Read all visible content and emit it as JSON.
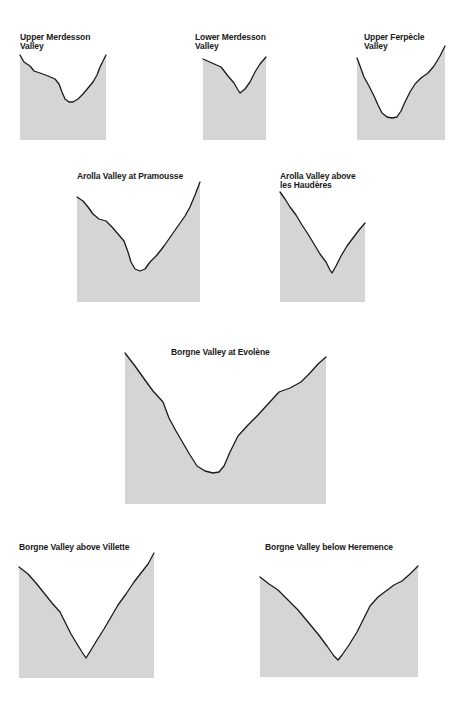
{
  "figure": {
    "fill_color": "#d5d5d5",
    "line_color": "#1a1a1a"
  },
  "panels": [
    {
      "id": "upper-merdesson",
      "title": "Upper Merdesson\nValley",
      "title_pos": [
        20,
        33
      ],
      "box": [
        20,
        55,
        106,
        140
      ],
      "profile": [
        [
          20,
          55
        ],
        [
          24,
          62
        ],
        [
          30,
          66
        ],
        [
          34,
          71
        ],
        [
          40,
          73
        ],
        [
          48,
          76
        ],
        [
          55,
          79
        ],
        [
          59,
          84
        ],
        [
          62,
          92
        ],
        [
          65,
          99
        ],
        [
          69,
          102
        ],
        [
          73,
          102
        ],
        [
          78,
          99
        ],
        [
          83,
          94
        ],
        [
          88,
          88
        ],
        [
          93,
          82
        ],
        [
          97,
          75
        ],
        [
          100,
          67
        ],
        [
          103,
          61
        ],
        [
          106,
          55
        ]
      ]
    },
    {
      "id": "lower-merdesson",
      "title": "Lower Merdesson\nValley",
      "title_pos": [
        195,
        33
      ],
      "box": [
        203,
        59,
        266,
        140
      ],
      "profile": [
        [
          203,
          59
        ],
        [
          212,
          63
        ],
        [
          221,
          67
        ],
        [
          228,
          76
        ],
        [
          234,
          83
        ],
        [
          238,
          90
        ],
        [
          240,
          93
        ],
        [
          245,
          89
        ],
        [
          250,
          82
        ],
        [
          255,
          72
        ],
        [
          260,
          64
        ],
        [
          266,
          57
        ]
      ]
    },
    {
      "id": "upper-ferpecle",
      "title": "Upper Ferpècle\nValley",
      "title_pos": [
        364,
        33
      ],
      "box": [
        357,
        45,
        445,
        140
      ],
      "profile": [
        [
          357,
          58
        ],
        [
          360,
          66
        ],
        [
          364,
          77
        ],
        [
          369,
          86
        ],
        [
          374,
          96
        ],
        [
          378,
          105
        ],
        [
          382,
          113
        ],
        [
          387,
          117
        ],
        [
          392,
          118
        ],
        [
          397,
          117
        ],
        [
          401,
          111
        ],
        [
          405,
          102
        ],
        [
          410,
          92
        ],
        [
          415,
          84
        ],
        [
          421,
          78
        ],
        [
          428,
          73
        ],
        [
          434,
          66
        ],
        [
          440,
          56
        ],
        [
          445,
          46
        ]
      ]
    },
    {
      "id": "arolla-pramousse",
      "title": "Arolla Valley at Pramousse",
      "title_pos": [
        77,
        172
      ],
      "box": [
        77,
        181,
        200,
        302
      ],
      "profile": [
        [
          77,
          197
        ],
        [
          83,
          201
        ],
        [
          88,
          207
        ],
        [
          93,
          214
        ],
        [
          99,
          219
        ],
        [
          106,
          221
        ],
        [
          112,
          227
        ],
        [
          118,
          234
        ],
        [
          124,
          241
        ],
        [
          128,
          252
        ],
        [
          131,
          262
        ],
        [
          135,
          269
        ],
        [
          140,
          271
        ],
        [
          145,
          269
        ],
        [
          150,
          262
        ],
        [
          157,
          255
        ],
        [
          164,
          246
        ],
        [
          171,
          236
        ],
        [
          178,
          226
        ],
        [
          185,
          216
        ],
        [
          190,
          207
        ],
        [
          195,
          195
        ],
        [
          200,
          182
        ]
      ]
    },
    {
      "id": "arolla-haudères",
      "title": "Arolla Valley above\nles Haudères",
      "title_pos": [
        280,
        172
      ],
      "box": [
        280,
        192,
        365,
        302
      ],
      "profile": [
        [
          280,
          192
        ],
        [
          285,
          199
        ],
        [
          290,
          207
        ],
        [
          296,
          215
        ],
        [
          302,
          225
        ],
        [
          308,
          234
        ],
        [
          314,
          244
        ],
        [
          320,
          254
        ],
        [
          326,
          262
        ],
        [
          330,
          270
        ],
        [
          332,
          273
        ],
        [
          336,
          266
        ],
        [
          341,
          256
        ],
        [
          347,
          246
        ],
        [
          353,
          238
        ],
        [
          359,
          230
        ],
        [
          365,
          223
        ]
      ]
    },
    {
      "id": "borgne-evolene",
      "title": "Borgne Valley at Evolène",
      "title_pos": [
        171,
        348
      ],
      "box": [
        125,
        353,
        326,
        504
      ],
      "profile": [
        [
          125,
          353
        ],
        [
          135,
          366
        ],
        [
          145,
          380
        ],
        [
          153,
          391
        ],
        [
          163,
          402
        ],
        [
          169,
          418
        ],
        [
          176,
          431
        ],
        [
          183,
          443
        ],
        [
          190,
          455
        ],
        [
          197,
          466
        ],
        [
          205,
          471
        ],
        [
          213,
          473
        ],
        [
          219,
          472
        ],
        [
          224,
          466
        ],
        [
          230,
          452
        ],
        [
          238,
          436
        ],
        [
          248,
          425
        ],
        [
          258,
          415
        ],
        [
          268,
          404
        ],
        [
          279,
          392
        ],
        [
          290,
          388
        ],
        [
          301,
          382
        ],
        [
          310,
          373
        ],
        [
          318,
          364
        ],
        [
          326,
          357
        ]
      ]
    },
    {
      "id": "borgne-villette",
      "title": "Borgne Valley above Villette",
      "title_pos": [
        19,
        543
      ],
      "box": [
        19,
        553,
        154,
        678
      ],
      "profile": [
        [
          19,
          567
        ],
        [
          28,
          574
        ],
        [
          36,
          583
        ],
        [
          44,
          593
        ],
        [
          52,
          603
        ],
        [
          60,
          612
        ],
        [
          66,
          624
        ],
        [
          71,
          634
        ],
        [
          77,
          644
        ],
        [
          82,
          652
        ],
        [
          86,
          658
        ],
        [
          91,
          650
        ],
        [
          97,
          640
        ],
        [
          104,
          629
        ],
        [
          111,
          617
        ],
        [
          118,
          605
        ],
        [
          126,
          594
        ],
        [
          134,
          582
        ],
        [
          141,
          573
        ],
        [
          148,
          564
        ],
        [
          154,
          553
        ]
      ]
    },
    {
      "id": "borgne-heremence",
      "title": "Borgne Valley below Heremence",
      "title_pos": [
        265,
        543
      ],
      "box": [
        260,
        566,
        418,
        677
      ],
      "profile": [
        [
          260,
          577
        ],
        [
          269,
          584
        ],
        [
          278,
          590
        ],
        [
          288,
          600
        ],
        [
          298,
          610
        ],
        [
          308,
          622
        ],
        [
          318,
          634
        ],
        [
          327,
          646
        ],
        [
          334,
          656
        ],
        [
          338,
          660
        ],
        [
          342,
          655
        ],
        [
          349,
          645
        ],
        [
          357,
          632
        ],
        [
          364,
          618
        ],
        [
          370,
          606
        ],
        [
          378,
          597
        ],
        [
          386,
          591
        ],
        [
          394,
          585
        ],
        [
          402,
          581
        ],
        [
          410,
          574
        ],
        [
          418,
          566
        ]
      ]
    }
  ]
}
